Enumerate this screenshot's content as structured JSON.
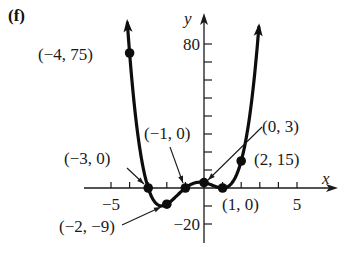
{
  "panel_label": "(f)",
  "chart_data": {
    "type": "line",
    "title": "",
    "function": "f(x) = (x+3)(x+1)(x-1)^2",
    "xlabel": "x",
    "ylabel": "y",
    "xlim": [
      -6.5,
      7
    ],
    "ylim": [
      -30,
      90
    ],
    "x_ticks": [
      -5,
      -4,
      -3,
      -2,
      -1,
      1,
      2,
      3,
      4,
      5
    ],
    "x_tick_labels": [
      {
        "value": -5,
        "text": "−5"
      },
      {
        "value": 5,
        "text": "5"
      }
    ],
    "y_ticks": [
      -20,
      -10,
      10,
      20,
      30,
      40,
      50,
      60,
      70,
      80
    ],
    "y_tick_labels": [
      {
        "value": 80,
        "text": "80"
      },
      {
        "value": -20,
        "text": "−20"
      }
    ],
    "grid": false,
    "legend": null,
    "points": [
      {
        "x": -4,
        "y": 75,
        "label": "(−4, 75)"
      },
      {
        "x": -3,
        "y": 0,
        "label": "(−3, 0)"
      },
      {
        "x": -2,
        "y": -9,
        "label": "(−2, −9)"
      },
      {
        "x": -1,
        "y": 0,
        "label": "(−1, 0)"
      },
      {
        "x": 0,
        "y": 3,
        "label": "(0, 3)"
      },
      {
        "x": 1,
        "y": 0,
        "label": "(1, 0)"
      },
      {
        "x": 2,
        "y": 15,
        "label": "(2, 15)"
      }
    ],
    "curve_range": [
      -4.12,
      2.95
    ]
  },
  "colors": {
    "curve": "#0d0d0d",
    "axis": "#1a1a1a",
    "text": "#1a1a1a",
    "background": "#ffffff"
  }
}
